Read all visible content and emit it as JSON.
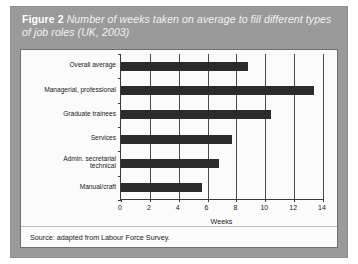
{
  "figure": {
    "number_label": "Figure 2",
    "caption": "Number of weeks taken on average to fill different types of job roles (UK, 2003)",
    "source": "Source: adapted from Labour Force Survey.",
    "header_color": "#9a9a9a",
    "bar_color": "#2b2b2b",
    "panel_color": "#fbfbfb"
  },
  "chart_data": {
    "type": "bar",
    "orientation": "horizontal",
    "title": "Number of weeks taken on average to fill different types of job roles (UK, 2003)",
    "categories": [
      "Overall average",
      "Managerial, professional",
      "Graduate trainees",
      "Services",
      "Admin. secretarial\ntechnical",
      "Manual/craft"
    ],
    "values": [
      8.8,
      13.4,
      10.4,
      7.7,
      6.8,
      5.6
    ],
    "xlabel": "Weeks",
    "ylabel": "",
    "xlim": [
      0,
      14
    ],
    "xticks": [
      0,
      2,
      4,
      6,
      8,
      10,
      12,
      14
    ],
    "xtick_labels": [
      "0",
      "2",
      "4",
      "6",
      "8",
      "10",
      "12",
      "14"
    ],
    "grid": true,
    "legend": false
  }
}
